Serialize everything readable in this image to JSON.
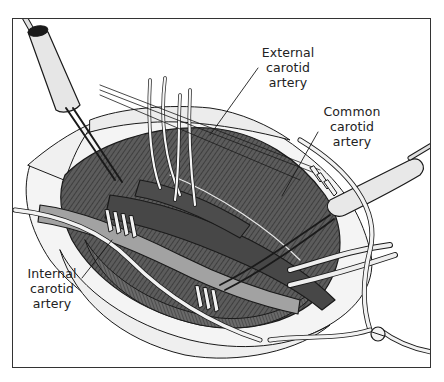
{
  "figure": {
    "style": "grayscale line drawing",
    "colors": {
      "background": "#ffffff",
      "border": "#333333",
      "artery_dark": "#4a4a4a",
      "artery_light": "#9a9a9a",
      "tissue": "#6e6e6e",
      "instrument": "#e8e8e8",
      "line": "#1a1a1a"
    }
  },
  "labels": {
    "external_carotid": "External\ncarotid\nartery",
    "common_carotid": "Common\ncarotid\nartery",
    "internal_carotid": "Internal\ncarotid\nartery"
  }
}
